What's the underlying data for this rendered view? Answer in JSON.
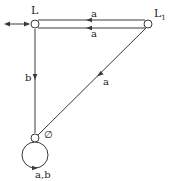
{
  "diagram": {
    "type": "state-transition-diagram",
    "colors": {
      "stroke": "#3a3a3a",
      "text": "#222222",
      "background": "#ffffff"
    },
    "states": [
      {
        "id": "L",
        "label": "L",
        "initial": true
      },
      {
        "id": "L1",
        "label": "L",
        "subscript": "1"
      },
      {
        "id": "empty",
        "label": "∅"
      }
    ],
    "transitions": [
      {
        "from": "L1",
        "to": "L",
        "label": "a",
        "route": "top-line"
      },
      {
        "from": "L",
        "to": "L1",
        "label": "a",
        "route": "bottom-line"
      },
      {
        "from": "L",
        "to": "empty",
        "label": "b"
      },
      {
        "from": "L1",
        "to": "empty",
        "label": "a"
      },
      {
        "from": "empty",
        "to": "empty",
        "label": "a,b",
        "route": "self-loop"
      }
    ],
    "initial_arrow": "↔"
  }
}
